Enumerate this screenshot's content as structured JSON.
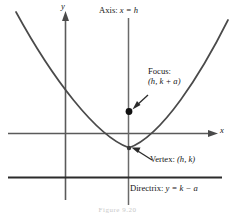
{
  "figure": {
    "type": "parabola-diagram",
    "caption": "Figure 9.20",
    "colors": {
      "curve": "#4a4a4a",
      "axis": "#5a5a5a",
      "line": "#2b2b2b",
      "text": "#151515",
      "background": "#ffffff"
    },
    "labels": {
      "axis_of_symmetry": {
        "prefix": "Axis:",
        "equation": "x = h"
      },
      "focus": {
        "prefix": "Focus:",
        "point": "(h, k + a)"
      },
      "vertex": {
        "prefix": "Vertex:",
        "point": "(h, k)"
      },
      "directrix": {
        "prefix": "Directrix:",
        "equation": "y = k − a"
      },
      "x_axis": "x",
      "y_axis": "y"
    },
    "geometry": {
      "x_axis": {
        "x1": 8,
        "y1": 133,
        "x2": 212,
        "y2": 133
      },
      "y_axis": {
        "x": 65,
        "y_top": 16,
        "y_bottom": 200
      },
      "axis_of_symmetry_line": {
        "x": 128,
        "y_top": 18,
        "y_bottom": 205
      },
      "directrix_line": {
        "x1": 8,
        "y1": 177,
        "x2": 222,
        "y2": 177
      },
      "vertex_point": {
        "x": 129,
        "y": 148
      },
      "focus_point": {
        "x": 129,
        "y": 111
      },
      "parabola": {
        "vertex_x": 129,
        "vertex_y": 148,
        "left_end_x": 16,
        "left_end_y": 12,
        "right_end_x": 228,
        "right_end_y": 20
      }
    }
  }
}
